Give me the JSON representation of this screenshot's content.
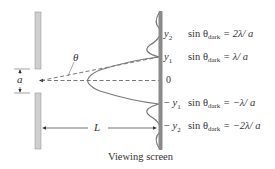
{
  "diagram": {
    "caption": "Viewing screen",
    "labels": {
      "slit_width": "a",
      "angle": "θ",
      "distance": "L",
      "center": "0"
    },
    "positions": [
      {
        "name": "y2",
        "sign": "",
        "sub": "2",
        "equation_lhs": "sin θ",
        "equation_sub": "dark",
        "equation_rhs": "= 2λ/ a"
      },
      {
        "name": "y1",
        "sign": "",
        "sub": "1",
        "equation_lhs": "sin θ",
        "equation_sub": "dark",
        "equation_rhs": "= λ/ a"
      },
      {
        "name": "-y1",
        "sign": "− ",
        "sub": "1",
        "equation_lhs": "sin θ",
        "equation_sub": "dark",
        "equation_rhs": "= −λ/ a"
      },
      {
        "name": "-y2",
        "sign": "− ",
        "sub": "2",
        "equation_lhs": "sin θ",
        "equation_sub": "dark",
        "equation_rhs": "= −2λ/ a"
      }
    ],
    "colors": {
      "barrier": "#c8c8c8",
      "screen": "#8a8a8a",
      "lines": "#555555",
      "curve": "#777777"
    }
  }
}
